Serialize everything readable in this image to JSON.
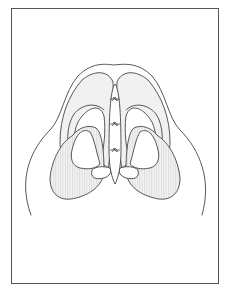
{
  "figure": {
    "colors": {
      "line": "#444444",
      "frame": "#555555",
      "cartilage_fill": "#f1f1f1",
      "hatch": "#d4d4d4",
      "background": "#ffffff"
    },
    "elements": {
      "frame": "border-frame",
      "outer_contour": "nasal-outer-contour",
      "lateral_crura": [
        "left-lateral-crus",
        "right-lateral-crus"
      ],
      "nostrils": [
        "left-nostril",
        "right-nostril"
      ],
      "columella_strut": "columellar-strut",
      "sutures_count": 3
    }
  }
}
